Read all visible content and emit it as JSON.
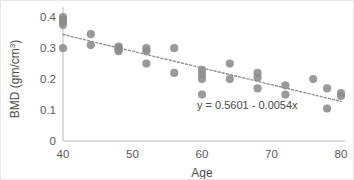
{
  "chart_data": {
    "type": "scatter",
    "title": "",
    "xlabel": "Age",
    "ylabel": "BMD (gm/cm3)",
    "ylabel_base": "BMD (gm/cm",
    "ylabel_sup": "3",
    "ylabel_tail": ")",
    "xlim": [
      40,
      80
    ],
    "ylim": [
      0,
      0.42
    ],
    "grid": false,
    "legend": null,
    "marker_color": "#8c8c8c",
    "trendline_color": "#8f8f8f",
    "axis_color": "#bdbdbd",
    "xticks": [
      40,
      50,
      60,
      70,
      80
    ],
    "xtick_labels": [
      "40",
      "50",
      "60",
      "70",
      "80"
    ],
    "yticks": [
      0,
      0.1,
      0.2,
      0.3,
      0.4
    ],
    "ytick_labels": [
      "0",
      "0.1",
      "0.2",
      "0.3",
      "0.4"
    ],
    "annotation": "y = 0.5601 - 0.0054x",
    "trendline": {
      "equation": "y = 0.5601 - 0.0054x",
      "intercept": 0.5601,
      "slope": -0.0054,
      "x_start": 40,
      "x_end": 80,
      "y_start": 0.3441,
      "y_end": 0.1281,
      "style": "dotted"
    },
    "x": [
      40,
      40,
      40,
      40,
      40,
      44,
      44,
      48,
      48,
      48,
      48,
      52,
      52,
      52,
      56,
      56,
      60,
      60,
      60,
      60,
      64,
      64,
      68,
      68,
      68,
      72,
      72,
      76,
      78,
      78,
      80,
      80
    ],
    "y": [
      0.4,
      0.392,
      0.385,
      0.375,
      0.3,
      0.345,
      0.31,
      0.305,
      0.3,
      0.295,
      0.29,
      0.3,
      0.29,
      0.25,
      0.3,
      0.22,
      0.23,
      0.215,
      0.2,
      0.15,
      0.25,
      0.2,
      0.22,
      0.205,
      0.17,
      0.18,
      0.15,
      0.2,
      0.17,
      0.105,
      0.155,
      0.145
    ],
    "points": [
      {
        "x": 40,
        "y": 0.4
      },
      {
        "x": 40,
        "y": 0.392
      },
      {
        "x": 40,
        "y": 0.385
      },
      {
        "x": 40,
        "y": 0.375
      },
      {
        "x": 40,
        "y": 0.3
      },
      {
        "x": 44,
        "y": 0.345
      },
      {
        "x": 44,
        "y": 0.31
      },
      {
        "x": 48,
        "y": 0.305
      },
      {
        "x": 48,
        "y": 0.3
      },
      {
        "x": 48,
        "y": 0.295
      },
      {
        "x": 48,
        "y": 0.29
      },
      {
        "x": 52,
        "y": 0.3
      },
      {
        "x": 52,
        "y": 0.29
      },
      {
        "x": 52,
        "y": 0.25
      },
      {
        "x": 56,
        "y": 0.3
      },
      {
        "x": 56,
        "y": 0.22
      },
      {
        "x": 60,
        "y": 0.23
      },
      {
        "x": 60,
        "y": 0.215
      },
      {
        "x": 60,
        "y": 0.2
      },
      {
        "x": 60,
        "y": 0.15
      },
      {
        "x": 64,
        "y": 0.25
      },
      {
        "x": 64,
        "y": 0.2
      },
      {
        "x": 68,
        "y": 0.22
      },
      {
        "x": 68,
        "y": 0.205
      },
      {
        "x": 68,
        "y": 0.17
      },
      {
        "x": 72,
        "y": 0.18
      },
      {
        "x": 72,
        "y": 0.15
      },
      {
        "x": 76,
        "y": 0.2
      },
      {
        "x": 78,
        "y": 0.17
      },
      {
        "x": 78,
        "y": 0.105
      },
      {
        "x": 80,
        "y": 0.155
      },
      {
        "x": 80,
        "y": 0.145
      }
    ]
  }
}
